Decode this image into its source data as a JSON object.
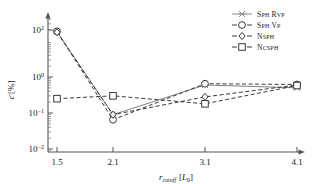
{
  "chart_data": {
    "type": "line",
    "title": "",
    "xlabel": "r_cutoff [L_0]",
    "ylabel": "ε̄ [%]",
    "x": [
      1.5,
      2.1,
      3.1,
      4.1
    ],
    "categories": [
      "1.5",
      "2.1",
      "3.1",
      "4.1"
    ],
    "xtick_labels": [
      "1.5",
      "2.1",
      "3.1",
      "4.1"
    ],
    "ytick_labels": [
      "10^2",
      "10^0",
      "10^-1",
      "10^-2"
    ],
    "ytick_values": [
      100,
      1,
      0.1,
      0.01
    ],
    "yscale": "log",
    "ylim": [
      0.01,
      300
    ],
    "xlim": [
      1.2,
      4.45
    ],
    "grid": false,
    "legend_position": "top-right",
    "series": [
      {
        "name": "Sph Rvp",
        "label_main": "S",
        "marker": "star",
        "linestyle": "solid",
        "color": "#808080",
        "values": [
          18.0,
          0.09,
          0.6,
          0.5
        ]
      },
      {
        "name": "Sph Vp",
        "marker": "circle",
        "linestyle": "dashed",
        "color": "#3a3a3a",
        "values": [
          18.5,
          0.065,
          0.65,
          0.62
        ]
      },
      {
        "name": "Nsph",
        "marker": "diamond",
        "linestyle": "dashed",
        "color": "#3a3a3a",
        "values": [
          17.5,
          0.09,
          0.28,
          0.6
        ]
      },
      {
        "name": "Ncsph",
        "marker": "square",
        "linestyle": "dashed",
        "color": "#3a3a3a",
        "values": [
          0.25,
          0.3,
          0.18,
          0.58
        ]
      }
    ]
  },
  "legend": {
    "entries": [
      {
        "label": "Sph Rvp",
        "head": "S",
        "rest": "PH ",
        "head2": "R",
        "rest2": "VP"
      },
      {
        "label": "Sph Vp"
      },
      {
        "label": "Nsph"
      },
      {
        "label": "Ncsph"
      }
    ]
  },
  "axis": {
    "y_label_eps": "ε",
    "y_label_unit": "[%]",
    "x_label_r": "r",
    "x_label_sub": "cutoff",
    "x_label_unit": "[L",
    "x_label_unit_sub": "0",
    "x_label_unit_close": "]"
  },
  "colors": {
    "axis": "#555555",
    "series_gray": "#8a8a8a",
    "series_dark": "#3a3a3a",
    "background": "#ffffff"
  }
}
